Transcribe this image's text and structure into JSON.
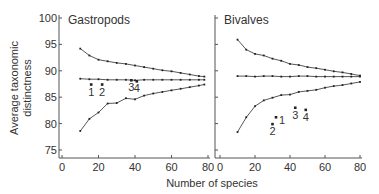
{
  "figure": {
    "ylabel_line1": "Average taxonomic",
    "ylabel_line2": "distinctness",
    "xlabel": "Number of species"
  },
  "chart_data": [
    {
      "type": "line",
      "title": "Gastropods",
      "xlabel": "Number of species",
      "ylabel": "Average taxonomic distinctness",
      "xlim": [
        0,
        80
      ],
      "ylim": [
        75,
        100
      ],
      "xticks": [
        0,
        20,
        40,
        60,
        80
      ],
      "yticks": [
        75,
        80,
        85,
        90,
        95,
        100
      ],
      "grid": false,
      "x": [
        10,
        15,
        20,
        25,
        30,
        35,
        40,
        45,
        50,
        55,
        60,
        65,
        70,
        75,
        78
      ],
      "series": [
        {
          "name": "upper limit",
          "values": [
            94.2,
            92.9,
            92.1,
            91.8,
            91.5,
            91.3,
            91.0,
            90.7,
            90.4,
            90.1,
            89.9,
            89.6,
            89.3,
            89.0,
            88.9
          ]
        },
        {
          "name": "mean",
          "values": [
            88.5,
            88.4,
            88.4,
            88.3,
            88.3,
            88.3,
            88.2,
            88.3,
            88.3,
            88.3,
            88.3,
            88.3,
            88.3,
            88.3,
            88.3
          ]
        },
        {
          "name": "lower limit",
          "values": [
            78.6,
            80.9,
            82.1,
            83.8,
            83.9,
            84.8,
            84.6,
            85.3,
            85.7,
            86.0,
            86.3,
            86.6,
            86.9,
            87.2,
            87.4
          ]
        }
      ],
      "points": [
        {
          "label": "1",
          "x": 16,
          "y": 87.4
        },
        {
          "label": "2",
          "x": 22,
          "y": 87.4
        },
        {
          "label": "3",
          "x": 38,
          "y": 88.2
        },
        {
          "label": "4",
          "x": 41,
          "y": 88.0
        }
      ]
    },
    {
      "type": "line",
      "title": "Bivalves",
      "xlabel": "Number of species",
      "ylabel": "Average taxonomic distinctness",
      "xlim": [
        0,
        80
      ],
      "ylim": [
        75,
        100
      ],
      "xticks": [
        0,
        20,
        40,
        60,
        80
      ],
      "yticks": [
        75,
        80,
        85,
        90,
        95,
        100
      ],
      "grid": false,
      "x": [
        10,
        15,
        20,
        25,
        30,
        35,
        40,
        45,
        50,
        55,
        60,
        65,
        70,
        75,
        80
      ],
      "series": [
        {
          "name": "upper limit",
          "values": [
            95.9,
            94.0,
            93.2,
            92.9,
            92.3,
            91.9,
            91.3,
            91.1,
            90.7,
            90.5,
            90.2,
            89.9,
            89.7,
            89.4,
            89.1
          ]
        },
        {
          "name": "mean",
          "values": [
            89.0,
            89.0,
            88.9,
            89.0,
            89.0,
            88.9,
            88.9,
            89.0,
            89.0,
            88.9,
            88.9,
            88.9,
            88.9,
            88.9,
            88.9
          ]
        },
        {
          "name": "lower limit",
          "values": [
            78.4,
            81.2,
            83.3,
            84.4,
            84.9,
            85.4,
            85.5,
            86.0,
            86.2,
            86.4,
            86.8,
            87.1,
            87.3,
            87.6,
            87.9
          ]
        }
      ],
      "points": [
        {
          "label": "1",
          "x": 32,
          "y": 81.2
        },
        {
          "label": "2",
          "x": 30,
          "y": 79.9
        },
        {
          "label": "3",
          "x": 43,
          "y": 83.0
        },
        {
          "label": "4",
          "x": 49,
          "y": 82.6
        }
      ]
    }
  ]
}
